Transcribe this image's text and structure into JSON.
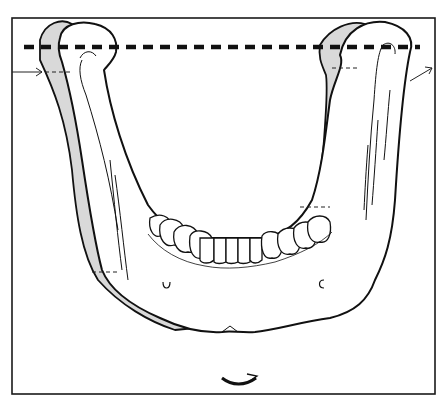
{
  "figure": {
    "colors": {
      "frame": "#1a1a1a",
      "outline": "#111111",
      "shadow_fill": "#d9d9d9",
      "bone_fill": "#ffffff",
      "background": "#ffffff"
    },
    "annotations": {
      "reference_line": "dashed-horizontal",
      "left_arrow": "pointing-right",
      "right_arrow": "pointing-up-right",
      "rotation_arrow": "curved-clockwise"
    }
  }
}
